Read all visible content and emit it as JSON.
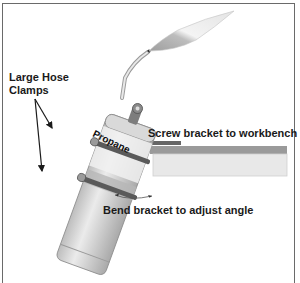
{
  "diagram": {
    "labels": {
      "hose_clamps": "Large Hose Clamps",
      "tank": "Propane",
      "screw": "Screw bracket to workbench",
      "bend": "Bend bracket to adjust angle"
    },
    "colors": {
      "frame": "#6a6a6a",
      "tank_body": "#cfcfcf",
      "tank_band": "#b7b7b7",
      "clamp": "#5a5a5a",
      "bracket": "#666666",
      "bench_top": "#9a9a9a",
      "bench_front": "#e6e6e6",
      "flame_inner": "#a8a8a8",
      "flame_outer": "#efefef"
    }
  }
}
